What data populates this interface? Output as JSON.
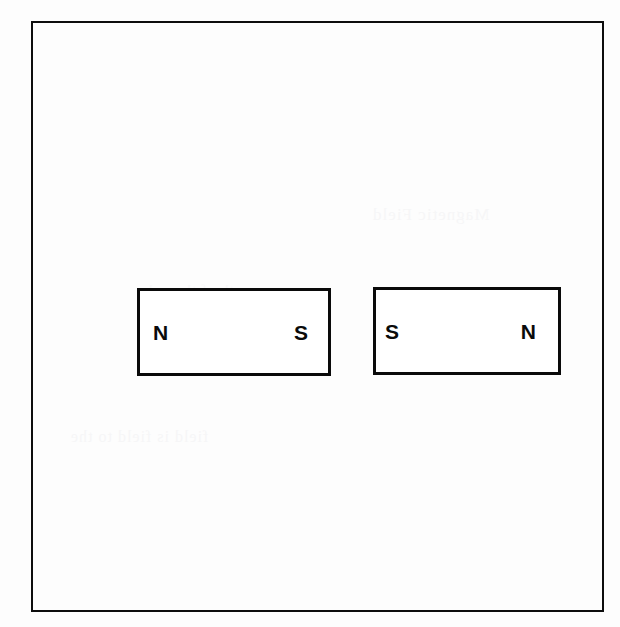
{
  "figure": {
    "frame_color": "#0d0d0d",
    "background_color": "#fdfdfd",
    "top_partial_glyph": "y",
    "magnets": [
      {
        "id": "magnet-left",
        "left_pole_label": "N",
        "right_pole_label": "S"
      },
      {
        "id": "magnet-right",
        "left_pole_label": "S",
        "right_pole_label": "N"
      }
    ],
    "ghost_text": {
      "line1": "Magnetic Field",
      "line2": "field is field to the",
      "line3": "north of the pole",
      "line4": "magnet in line"
    }
  }
}
